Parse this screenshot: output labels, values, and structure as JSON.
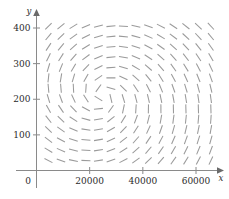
{
  "chart_data": {
    "type": "scatter",
    "plot_kind": "direction-field",
    "title": "",
    "subtitle": "",
    "xlabel": "x",
    "ylabel": "y",
    "xlim": [
      0,
      68000
    ],
    "ylim": [
      0,
      440
    ],
    "grid": false,
    "legend": null,
    "annotations": [],
    "xticks": [
      {
        "value": 0,
        "label": "0"
      },
      {
        "value": 20000,
        "label": "20000"
      },
      {
        "value": 40000,
        "label": "40000"
      },
      {
        "value": 60000,
        "label": "60000"
      }
    ],
    "yticks": [
      {
        "value": 100,
        "label": "100"
      },
      {
        "value": 200,
        "label": "200"
      },
      {
        "value": 300,
        "label": "300"
      },
      {
        "value": 400,
        "label": "400"
      }
    ],
    "field": {
      "description": "slope field of short gray dashes showing a counter-clockwise spiral/vortex",
      "center": {
        "x": 25000,
        "y": 208
      },
      "dash_length_px": 9,
      "dash_color": "#9a9a9a",
      "columns": 14,
      "rows": 14,
      "x_start": 4500,
      "x_step": 4700,
      "y_start": 28,
      "y_step": 29
    }
  },
  "axes": {
    "x_axis_label": "x",
    "y_axis_label": "y",
    "origin_label": "0",
    "axis_color": "#8a8a8a"
  },
  "colors": {
    "background": "#ffffff",
    "axis": "#8a8a8a",
    "dash": "#9a9a9a",
    "text": "#2b2b2b"
  }
}
